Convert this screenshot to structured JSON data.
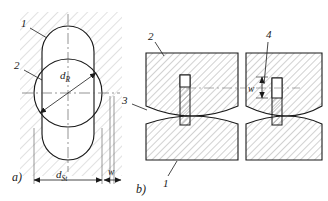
{
  "figure": {
    "title_hidden": "",
    "subfigures": [
      {
        "key": "a",
        "caption": "a)",
        "description": "plan view of roller in stator bore",
        "callouts": [
          {
            "id": "1",
            "label": "1",
            "target": "stator-bore-outline"
          },
          {
            "id": "2",
            "label": "2",
            "target": "roller-circle"
          }
        ],
        "dimensions": [
          {
            "name": "roller-diameter",
            "label": "d",
            "sub": "R"
          },
          {
            "name": "stator-diameter",
            "label": "d",
            "sub": "St"
          },
          {
            "name": "gap-width",
            "label": "w",
            "sub": ""
          }
        ]
      },
      {
        "key": "b",
        "caption": "b)",
        "description": "sectional view of upper and lower dies with pin, two states",
        "callouts": [
          {
            "id": "2",
            "label": "2",
            "target": "upper-die-left"
          },
          {
            "id": "4",
            "label": "4",
            "target": "pin-right"
          },
          {
            "id": "3",
            "label": "3",
            "target": "gap-left"
          },
          {
            "id": "1",
            "label": "1",
            "target": "lower-die-left"
          }
        ],
        "dimensions": [
          {
            "name": "offset-width",
            "label": "w",
            "sub": ""
          }
        ]
      }
    ]
  },
  "colors": {
    "line": "#1a1a1a",
    "hatch": "#b8b8b8",
    "thin": "#555555",
    "paper": "#ffffff"
  }
}
